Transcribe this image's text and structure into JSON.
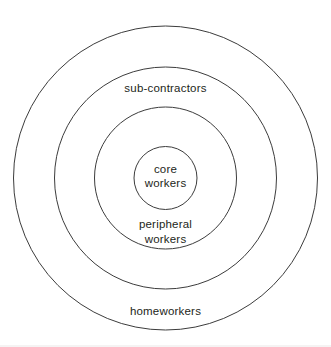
{
  "diagram": {
    "type": "concentric-rings",
    "rings": [
      {
        "name": "core-workers",
        "label_line1": "core",
        "label_line2": "workers"
      },
      {
        "name": "peripheral-workers",
        "label_line1": "peripheral",
        "label_line2": "workers"
      },
      {
        "name": "sub-contractors",
        "label": "sub-contractors"
      },
      {
        "name": "homeworkers",
        "label": "homeworkers"
      }
    ],
    "colors": {
      "ring_stroke": "#3c3c3c",
      "text": "#231f20",
      "background": "#ffffff"
    }
  }
}
